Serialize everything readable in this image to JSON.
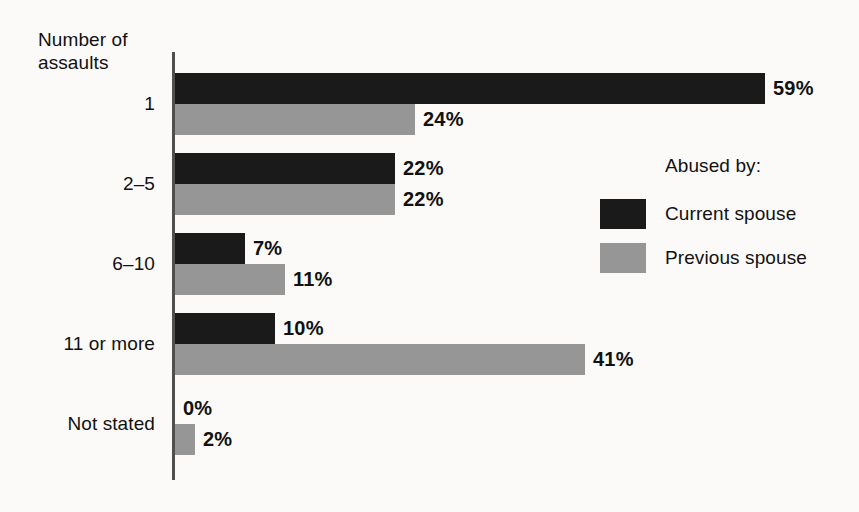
{
  "chart_data": {
    "type": "bar",
    "orientation": "horizontal",
    "title": "",
    "xlabel": "",
    "ylabel": "Number of assaults",
    "categories": [
      "1",
      "2–5",
      "6–10",
      "11 or more",
      "Not stated"
    ],
    "series": [
      {
        "name": "Current spouse",
        "color": "#1a1a1a",
        "values": [
          59,
          22,
          7,
          10,
          0
        ],
        "labels": [
          "59%",
          "22%",
          "7%",
          "10%",
          "0%"
        ]
      },
      {
        "name": "Previous spouse",
        "color": "#969696",
        "values": [
          24,
          22,
          11,
          41,
          2
        ],
        "labels": [
          "24%",
          "22%",
          "11%",
          "41%",
          "2%"
        ]
      }
    ],
    "xlim": [
      0,
      68
    ],
    "grid": false,
    "legend_position": "right",
    "value_unit": "%"
  },
  "axis": {
    "title": "Number of\nassaults"
  },
  "legend": {
    "title": "Abused by:",
    "entries": [
      {
        "label": "Current spouse",
        "color": "#1a1a1a"
      },
      {
        "label": "Previous spouse",
        "color": "#969696"
      }
    ]
  },
  "colors": {
    "current_spouse": "#1a1a1a",
    "previous_spouse": "#969696",
    "background": "#fbfaf8",
    "axis_line": "#4f4f4f",
    "text": "#111111"
  }
}
